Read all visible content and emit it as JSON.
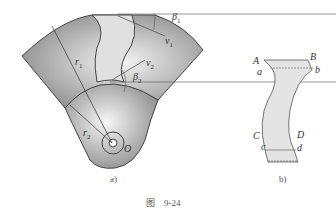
{
  "figure_a": {
    "caption": "a)",
    "labels": {
      "beta1": "β",
      "beta1_sub": "1",
      "v1": "v",
      "v1_sub": "1",
      "v2": "v",
      "v2_sub": "2",
      "beta2": "β",
      "beta2_sub": "2",
      "r1": "r",
      "r1_sub": "1",
      "r2": "r",
      "r2_sub": "2",
      "origin": "O"
    }
  },
  "figure_b": {
    "caption": "b)",
    "labels": {
      "A": "A",
      "B": "B",
      "a": "a",
      "b": "b",
      "C": "C",
      "D": "D",
      "c": "c",
      "d": "d"
    }
  },
  "caption": "图　9-24",
  "colors": {
    "fill_dark": "#9a9a9a",
    "fill_light": "#e8e8e8",
    "stroke": "#444444"
  }
}
